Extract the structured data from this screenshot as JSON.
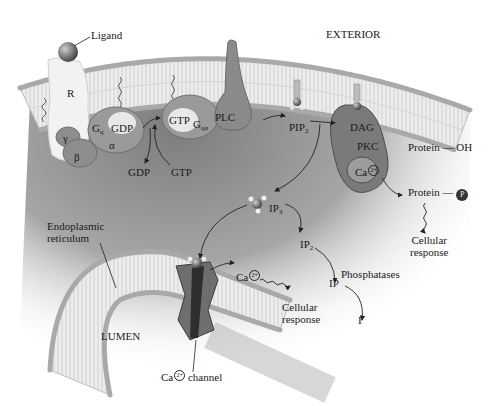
{
  "diagram": {
    "regions": {
      "exterior": "EXTERIOR",
      "lumen": "LUMEN",
      "er": "Endoplasmic reticulum",
      "er_line1": "Endoplasmic",
      "er_line2": "reticulum"
    },
    "receptor": {
      "ligand": "Ligand",
      "receptor": "R"
    },
    "g_protein": {
      "gamma": "γ",
      "beta": "β",
      "gq": "G",
      "gq_sub": "q",
      "gdp_bound": "GDP",
      "alpha": "α",
      "gtp_bound": "GTP",
      "gqa": "G",
      "gqa_sub": "qα",
      "gdp_released": "GDP",
      "gtp_incoming": "GTP"
    },
    "plc": "PLC",
    "pip2": {
      "base": "PIP",
      "sub": "2"
    },
    "pkc": {
      "dag": "DAG",
      "pkc": "PKC",
      "ca": "Ca",
      "ca_charge": "2+"
    },
    "protein": {
      "protein_oh": "Protein",
      "oh": "OH",
      "protein_p": "Protein",
      "p": "P",
      "response_line1": "Cellular",
      "response_line2": "response"
    },
    "ip_pathway": {
      "ip3_base": "IP",
      "ip3_sub": "3",
      "ip2_base": "IP",
      "ip2_sub": "2",
      "ip": "IP",
      "phosphatases": "Phosphatases",
      "inositol": "I"
    },
    "calcium": {
      "ca_released": "Ca",
      "ca_charge": "2+",
      "response_line1": "Cellular",
      "response_line2": "response",
      "channel_ca": "Ca",
      "channel_charge": "2+",
      "channel_word": "channel"
    },
    "colors": {
      "cytoplasm_dark": "#8a8a8a",
      "membrane_head": "#b5b5b5",
      "membrane_tail": "#e8e8e8",
      "protein_dark": "#6e6e6e",
      "protein_mid": "#9a9a9a",
      "text": "#1a1a1a"
    }
  }
}
